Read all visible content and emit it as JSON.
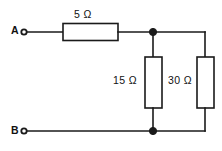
{
  "diagram": {
    "type": "electrical-circuit-schematic",
    "line_color": "#1a1a1a",
    "background_color": "#ffffff",
    "terminals": [
      {
        "id": "A",
        "label": "A",
        "position": "top-left"
      },
      {
        "id": "B",
        "label": "B",
        "position": "bottom-left"
      }
    ],
    "components": [
      {
        "id": "r1",
        "kind": "resistor",
        "label": "5 Ω",
        "value": 5,
        "unit": "Ω",
        "orientation": "horizontal",
        "connection": "series"
      },
      {
        "id": "r2",
        "kind": "resistor",
        "label": "15 Ω",
        "value": 15,
        "unit": "Ω",
        "orientation": "vertical",
        "connection": "parallel"
      },
      {
        "id": "r3",
        "kind": "resistor",
        "label": "30 Ω",
        "value": 30,
        "unit": "Ω",
        "orientation": "vertical",
        "connection": "parallel"
      }
    ],
    "nodes": [
      {
        "id": "top-node",
        "kind": "junction-dot"
      },
      {
        "id": "bottom-node",
        "kind": "junction-dot"
      }
    ]
  }
}
